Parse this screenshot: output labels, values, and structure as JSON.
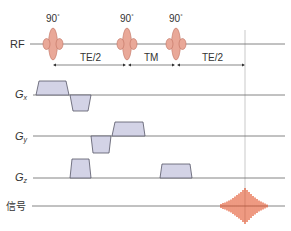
{
  "diagram": {
    "type": "pulse-sequence",
    "rows": [
      {
        "id": "rf",
        "label": "RF"
      },
      {
        "id": "gx",
        "label": "G",
        "subscript": "x"
      },
      {
        "id": "gy",
        "label": "G",
        "subscript": "y"
      },
      {
        "id": "gz",
        "label": "G",
        "subscript": "z"
      },
      {
        "id": "signal",
        "label": "信号"
      }
    ],
    "pulses": [
      {
        "label": "90°",
        "flip": "90",
        "deg": "°"
      },
      {
        "label": "90°",
        "flip": "90",
        "deg": "°"
      },
      {
        "label": "90°",
        "flip": "90",
        "deg": "°"
      }
    ],
    "intervals": [
      {
        "label": "TE/2"
      },
      {
        "label": "TM"
      },
      {
        "label": "TE/2"
      }
    ],
    "colors": {
      "pulse_fill": "#e9a898",
      "pulse_stroke": "#c0705f",
      "gradient_fill": "#d3d3e6",
      "gradient_stroke": "#555566",
      "signal": "#e0461a",
      "line": "#666666"
    }
  }
}
